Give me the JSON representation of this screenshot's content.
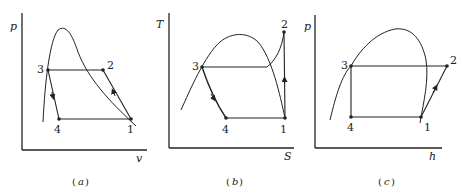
{
  "figure": {
    "panels": [
      {
        "id": "a",
        "caption_open": "(",
        "caption_letter": "a",
        "caption_close": ")",
        "y_axis_label": "p",
        "x_axis_label": "v",
        "points": [
          {
            "label": "1"
          },
          {
            "label": "2"
          },
          {
            "label": "3"
          },
          {
            "label": "4"
          }
        ]
      },
      {
        "id": "b",
        "caption_open": "(",
        "caption_letter": "b",
        "caption_close": ")",
        "y_axis_label": "T",
        "x_axis_label": "S",
        "points": [
          {
            "label": "1"
          },
          {
            "label": "2"
          },
          {
            "label": "3"
          },
          {
            "label": "4"
          }
        ]
      },
      {
        "id": "c",
        "caption_open": "(",
        "caption_letter": "c",
        "caption_close": ")",
        "y_axis_label": "p",
        "x_axis_label": "h",
        "points": [
          {
            "label": "1"
          },
          {
            "label": "2"
          },
          {
            "label": "3"
          },
          {
            "label": "4"
          }
        ]
      }
    ],
    "colors": {
      "ink": "#222222",
      "background": "#ffffff"
    }
  }
}
